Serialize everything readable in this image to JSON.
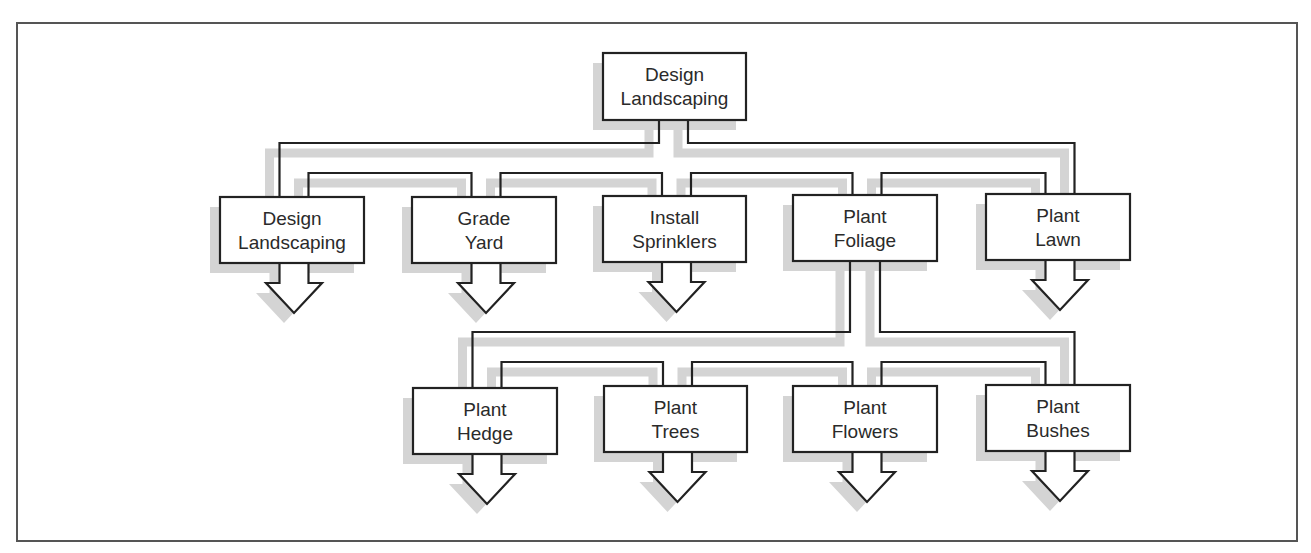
{
  "diagram": {
    "colors": {
      "line": "#222222",
      "shadow": "#d4d4d4",
      "frame": "#555555",
      "box_fill": "#ffffff",
      "text": "#2a2a2a"
    },
    "root": {
      "id": "design-landscaping-root",
      "lines": [
        "Design",
        "Landscaping"
      ],
      "box": {
        "x": 603,
        "y": 53,
        "w": 143,
        "h": 67
      }
    },
    "level1": [
      {
        "id": "design-landscaping",
        "lines": [
          "Design",
          "Landscaping"
        ],
        "box": {
          "x": 220,
          "y": 197,
          "w": 144,
          "h": 66
        },
        "has_arrow": true
      },
      {
        "id": "grade-yard",
        "lines": [
          "Grade",
          "Yard"
        ],
        "box": {
          "x": 412,
          "y": 197,
          "w": 144,
          "h": 66
        },
        "has_arrow": true
      },
      {
        "id": "install-sprinklers",
        "lines": [
          "Install",
          "Sprinklers"
        ],
        "box": {
          "x": 603,
          "y": 196,
          "w": 143,
          "h": 66
        },
        "has_arrow": true
      },
      {
        "id": "plant-foliage",
        "lines": [
          "Plant",
          "Foliage"
        ],
        "box": {
          "x": 793,
          "y": 195,
          "w": 144,
          "h": 66
        },
        "has_arrow": false
      },
      {
        "id": "plant-lawn",
        "lines": [
          "Plant",
          "Lawn"
        ],
        "box": {
          "x": 986,
          "y": 194,
          "w": 144,
          "h": 66
        },
        "has_arrow": true
      }
    ],
    "level2_parent": "plant-foliage",
    "level2": [
      {
        "id": "plant-hedge",
        "lines": [
          "Plant",
          "Hedge"
        ],
        "box": {
          "x": 413,
          "y": 388,
          "w": 144,
          "h": 66
        },
        "has_arrow": true
      },
      {
        "id": "plant-trees",
        "lines": [
          "Plant",
          "Trees"
        ],
        "box": {
          "x": 604,
          "y": 386,
          "w": 143,
          "h": 66
        },
        "has_arrow": true
      },
      {
        "id": "plant-flowers",
        "lines": [
          "Plant",
          "Flowers"
        ],
        "box": {
          "x": 793,
          "y": 386,
          "w": 144,
          "h": 66
        },
        "has_arrow": true
      },
      {
        "id": "plant-bushes",
        "lines": [
          "Plant",
          "Bushes"
        ],
        "box": {
          "x": 986,
          "y": 385,
          "w": 144,
          "h": 66
        },
        "has_arrow": true
      }
    ],
    "connectors": {
      "level1": {
        "stem_left": 659,
        "stem_right": 688,
        "outer_y": 143,
        "inner_y": 173
      },
      "level2": {
        "stem_left": 850,
        "stem_right": 880,
        "outer_y": 332,
        "inner_y": 362
      }
    },
    "frame": {
      "x": 17,
      "y": 23,
      "w": 1280,
      "h": 518
    }
  }
}
